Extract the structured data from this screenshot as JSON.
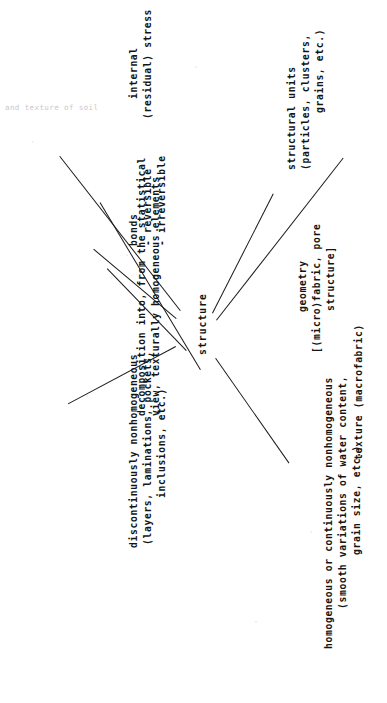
{
  "figure": {
    "kind": "typewritten-tree-diagram",
    "orientation": "rotated-90-counterclockwise",
    "page_background": "#ffffff",
    "ink_color": "#141414",
    "header_fragment": "and texture of soil",
    "center_node": "structure",
    "branch_count": 5
  },
  "branches": [
    {
      "id": "texture",
      "label": "texture (macrofabric)",
      "lines": [
        "texture (macrofabric)"
      ]
    },
    {
      "id": "homogeneous",
      "label": "homogeneous or continuously nonhomogeneous",
      "lines": [
        "homogeneous or continuously nonhomogeneous",
        "(smooth variations of water content,",
        "grain size, etc.)"
      ]
    },
    {
      "id": "discontinuous",
      "label": "discontinuously nonhomogeneous",
      "lines": [
        "discontinuously nonhomogeneous",
        "(layers, laminations, pockets,",
        "inclusions, etc.)"
      ]
    },
    {
      "id": "decomposition",
      "label": "decomposition into, from the statistical view, texturally homogeneous elements",
      "lines": [
        "decomposition into, from the statistical",
        "view, texturally homogeneous elements"
      ]
    },
    {
      "id": "bonds",
      "label": "bonds",
      "lines": [
        "bonds",
        "- reversible",
        "- irreversible"
      ]
    },
    {
      "id": "stress",
      "label": "internal (residual) stress",
      "lines": [
        "internal",
        "(residual) stress"
      ]
    },
    {
      "id": "geometry",
      "label": "geometry",
      "lines": [
        "geometry",
        "[(micro)fabric, pore",
        "structure]"
      ]
    },
    {
      "id": "structural-units",
      "label": "structural units",
      "lines": [
        "structural units",
        "(particles, clusters,",
        "grains, etc.)"
      ]
    }
  ],
  "text": {
    "header_fragment": "and texture of soil",
    "center": "structure",
    "texture_1": "texture (macrofabric)",
    "homog_1": "homogeneous or continuously nonhomogeneous",
    "homog_2": "(smooth variations of water content,",
    "homog_3": "grain size, etc.)",
    "discont_1": "discontinuously nonhomogeneous",
    "discont_2": "(layers, laminations, pockets,",
    "discont_3": "inclusions, etc.)",
    "decomp_1": "decomposition into, from the statistical",
    "decomp_2": "view, texturally homogeneous elements",
    "bonds_1": "bonds",
    "bonds_2": "- reversible",
    "bonds_3": "- irreversible",
    "stress_1": "internal",
    "stress_2": "(residual) stress",
    "geom_1": "geometry",
    "geom_2": "[(micro)fabric, pore",
    "geom_3": "structure]",
    "units_1": "structural units",
    "units_2": "(particles, clusters,",
    "units_3": "grains, etc.)"
  }
}
